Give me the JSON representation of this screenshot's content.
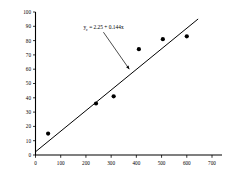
{
  "chart_data": {
    "type": "scatter",
    "title": "",
    "xlabel": "",
    "ylabel": "",
    "xlim": [
      0,
      700
    ],
    "ylim": [
      0,
      100
    ],
    "xticks": [
      0,
      100,
      200,
      300,
      400,
      500,
      600,
      700
    ],
    "yticks": [
      0,
      10,
      20,
      30,
      40,
      50,
      60,
      70,
      80,
      90,
      100
    ],
    "grid": false,
    "legend": null,
    "series": [
      {
        "name": "observations",
        "marker": "filled-circle",
        "color": "#000000",
        "points": [
          {
            "x": 50,
            "y": 15
          },
          {
            "x": 240,
            "y": 36
          },
          {
            "x": 310,
            "y": 41
          },
          {
            "x": 410,
            "y": 74
          },
          {
            "x": 505,
            "y": 81
          },
          {
            "x": 600,
            "y": 83
          }
        ]
      },
      {
        "name": "regression-line",
        "type": "line",
        "color": "#000000",
        "equation": "y = 2.25 + 0.144x",
        "intercept": 2.25,
        "slope": 0.144,
        "x_start": 0,
        "x_end": 645
      }
    ],
    "annotations": [
      {
        "name": "equation-label",
        "text_main": "y",
        "text_sub": "c",
        "text_rest": " = 2.25 + 0.144x",
        "full_text": "yc = 2.25 + 0.144x",
        "x": 190,
        "y": 88,
        "arrow_to_x": 372,
        "arrow_to_y": 60
      }
    ]
  },
  "axes": {
    "x_tick_labels": [
      "0",
      "100",
      "200",
      "300",
      "400",
      "500",
      "600",
      "700"
    ],
    "y_tick_labels": [
      "0",
      "10",
      "20",
      "30",
      "40",
      "50",
      "60",
      "70",
      "80",
      "90",
      "100"
    ]
  },
  "colors": {
    "axis": "#000000",
    "marker": "#000000",
    "line": "#000000",
    "background": "#ffffff"
  }
}
